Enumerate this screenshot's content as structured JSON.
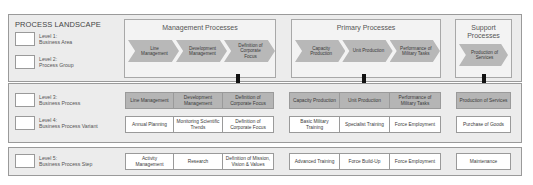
{
  "title": "PROCESS LANDSCAPE",
  "levels": [
    {
      "label": "Level 1:",
      "desc": "Business Area"
    },
    {
      "label": "Level 2:",
      "desc": "Process Group"
    },
    {
      "label": "Level 3:",
      "desc": "Business Process"
    },
    {
      "label": "Level 4:",
      "desc": "Business Process Variant"
    },
    {
      "label": "Level 5:",
      "desc": "Business Process Step"
    }
  ],
  "groups": [
    {
      "title": "Management Processes",
      "chevrons": [
        "Line Management",
        "Development Management",
        "Definition of Corporate Focus"
      ],
      "level3": [
        "Line Management",
        "Development Management",
        "Definition of Corporate Focus"
      ],
      "level4": [
        "Annual Planning",
        "Monitoring Scientific Trends",
        "Definition of Corporate Focus"
      ],
      "level5": [
        "Activity Management",
        "Research",
        "Definition of Mission, Vision & Values"
      ]
    },
    {
      "title": "Primary Processes",
      "chevrons": [
        "Capacity Production",
        "Unit Production",
        "Performance of Military Tasks"
      ],
      "level3": [
        "Capacity Production",
        "Unit Production",
        "Performance of Military Tasks"
      ],
      "level4": [
        "Basic Military Training",
        "Specialist Training",
        "Force Employment"
      ],
      "level5": [
        "Advanced Training",
        "Force Build-Up",
        "Force Employment"
      ]
    },
    {
      "title": "Support Processes",
      "chevrons": [
        "Production of Services"
      ],
      "level3": [
        "Production of Services"
      ],
      "level4": [
        "Purchase of Goods"
      ],
      "level5": [
        "Maintenance"
      ]
    }
  ],
  "colors": {
    "section_bg": "#ececec",
    "chevron_fill": "#b8b8b8",
    "level3_fill": "#b5b5b5",
    "arrow": "#111111"
  }
}
